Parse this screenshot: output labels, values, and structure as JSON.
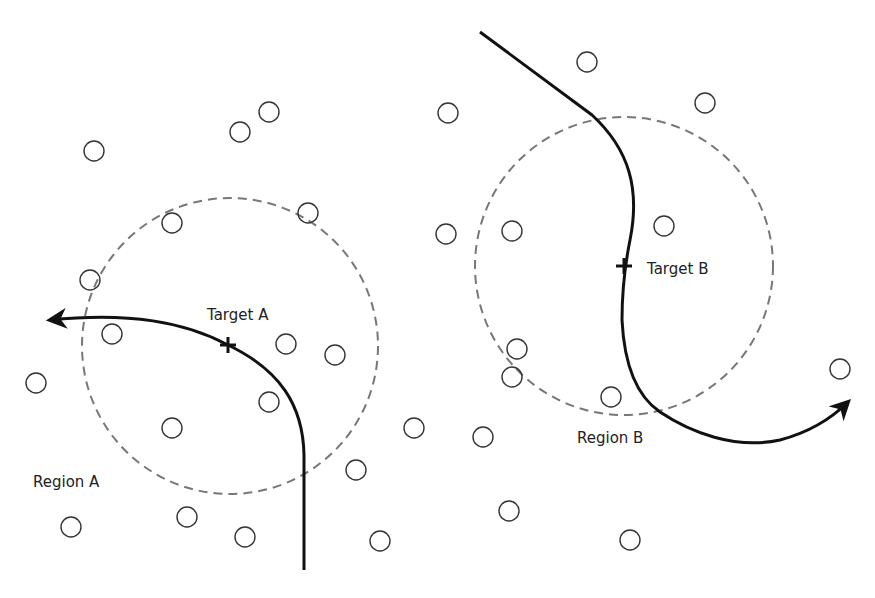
{
  "diagram": {
    "width": 875,
    "height": 598,
    "colors": {
      "background": "#ffffff",
      "path": "#111111",
      "region_dash": "#777777",
      "node_stroke": "#333333",
      "label": "#222222"
    },
    "regions": [
      {
        "id": "A",
        "label": "Region A",
        "cx": 230,
        "cy": 346,
        "r": 148,
        "label_x": 33,
        "label_y": 487
      },
      {
        "id": "B",
        "label": "Region B",
        "cx": 624,
        "cy": 266,
        "r": 149,
        "label_x": 577,
        "label_y": 443
      }
    ],
    "targets": [
      {
        "id": "A",
        "label": "Target A",
        "x": 228,
        "y": 345,
        "label_x": 207,
        "label_y": 320
      },
      {
        "id": "B",
        "label": "Target B",
        "x": 624,
        "y": 266,
        "label_x": 647,
        "label_y": 274
      }
    ],
    "paths": [
      {
        "id": "path-a",
        "d": "M 304 570 L 304 455 C 303 405 280 370 228 345 C 185 322 130 312 50 320"
      },
      {
        "id": "path-b",
        "d": "M 480 32 L 592 115 C 630 150 640 190 630 240 C 626 260 622 290 622 320 C 624 360 635 395 660 412 C 690 432 735 450 780 440 C 810 432 832 418 848 402"
      }
    ],
    "nodes": [
      {
        "x": 94,
        "y": 151
      },
      {
        "x": 240,
        "y": 132
      },
      {
        "x": 269,
        "y": 112
      },
      {
        "x": 172,
        "y": 223
      },
      {
        "x": 308,
        "y": 213
      },
      {
        "x": 90,
        "y": 280
      },
      {
        "x": 112,
        "y": 334
      },
      {
        "x": 286,
        "y": 344
      },
      {
        "x": 335,
        "y": 355
      },
      {
        "x": 36,
        "y": 383
      },
      {
        "x": 269,
        "y": 402
      },
      {
        "x": 172,
        "y": 428
      },
      {
        "x": 356,
        "y": 470
      },
      {
        "x": 71,
        "y": 527
      },
      {
        "x": 187,
        "y": 517
      },
      {
        "x": 245,
        "y": 537
      },
      {
        "x": 380,
        "y": 541
      },
      {
        "x": 448,
        "y": 113
      },
      {
        "x": 587,
        "y": 62
      },
      {
        "x": 705,
        "y": 103
      },
      {
        "x": 446,
        "y": 234
      },
      {
        "x": 512,
        "y": 231
      },
      {
        "x": 664,
        "y": 226
      },
      {
        "x": 517,
        "y": 349
      },
      {
        "x": 512,
        "y": 377
      },
      {
        "x": 611,
        "y": 397
      },
      {
        "x": 414,
        "y": 428
      },
      {
        "x": 483,
        "y": 437
      },
      {
        "x": 840,
        "y": 369
      },
      {
        "x": 509,
        "y": 511
      },
      {
        "x": 630,
        "y": 540
      }
    ],
    "node_radius": 10
  }
}
